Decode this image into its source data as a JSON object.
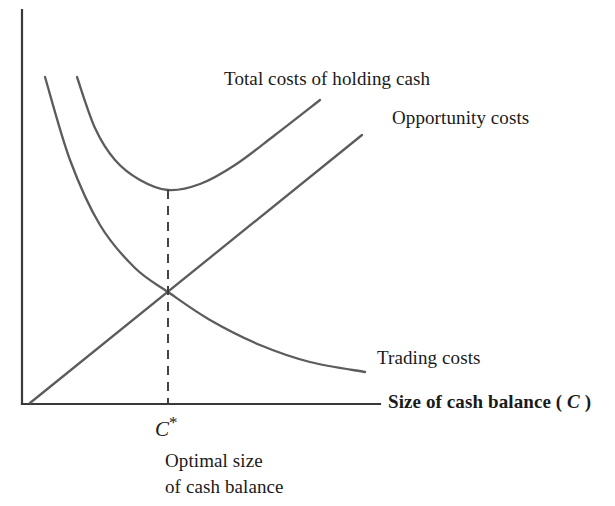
{
  "figure": {
    "background_color": "#ffffff",
    "axis_color": "#3a3a3a",
    "curve_color": "#5c5c5c",
    "text_color": "#1a1a1a"
  },
  "labels": {
    "total_costs": "Total costs of holding cash",
    "opportunity_costs": "Opportunity costs",
    "trading_costs": "Trading costs",
    "x_axis_prefix": "Size of cash balance ( ",
    "x_axis_variable": "C",
    "x_axis_suffix": " )",
    "c_star_variable": "C",
    "c_star_mark": "*",
    "optimal_line1": "Optimal size",
    "optimal_line2": "of cash balance"
  },
  "chart_data": {
    "type": "line",
    "title": "",
    "xlabel": "Size of cash balance ( C )",
    "ylabel": "",
    "grid": false,
    "legend_position": "inline-annotations",
    "axes": {
      "x_axis": {
        "x_start": 22,
        "x_end": 380,
        "y": 404
      },
      "y_axis": {
        "x": 22,
        "y_start": 10,
        "y_end": 404
      },
      "ticks": [],
      "tick_labels": []
    },
    "annotations": [
      {
        "name": "optimal-point-marker",
        "label": "C*",
        "x_px": 168,
        "y_px": 404,
        "note": "Optimal size of cash balance"
      },
      {
        "name": "dashed-optimum-line",
        "from": [
          168,
          190
        ],
        "to": [
          168,
          404
        ],
        "style": "dashed"
      }
    ],
    "series": [
      {
        "name": "Total costs of holding cash",
        "shape": "u-curve",
        "color": "#5c5c5c",
        "minimum_px": [
          168,
          190
        ],
        "points_px": [
          [
            77,
            77
          ],
          [
            95,
            128
          ],
          [
            115,
            160
          ],
          [
            140,
            180
          ],
          [
            168,
            190
          ],
          [
            200,
            184
          ],
          [
            235,
            165
          ],
          [
            275,
            135
          ],
          [
            320,
            100
          ]
        ]
      },
      {
        "name": "Opportunity costs",
        "shape": "linear-increasing",
        "color": "#5c5c5c",
        "points_px": [
          [
            30,
            403
          ],
          [
            362,
            135
          ]
        ]
      },
      {
        "name": "Trading costs",
        "shape": "decreasing-convex",
        "color": "#5c5c5c",
        "points_px": [
          [
            45,
            77
          ],
          [
            70,
            160
          ],
          [
            100,
            225
          ],
          [
            135,
            268
          ],
          [
            168,
            292
          ],
          [
            210,
            320
          ],
          [
            260,
            345
          ],
          [
            310,
            362
          ],
          [
            365,
            372
          ]
        ]
      }
    ],
    "intersections": [
      {
        "series": [
          "Opportunity costs",
          "Trading costs"
        ],
        "x_px": 168,
        "y_px": 292
      }
    ]
  }
}
